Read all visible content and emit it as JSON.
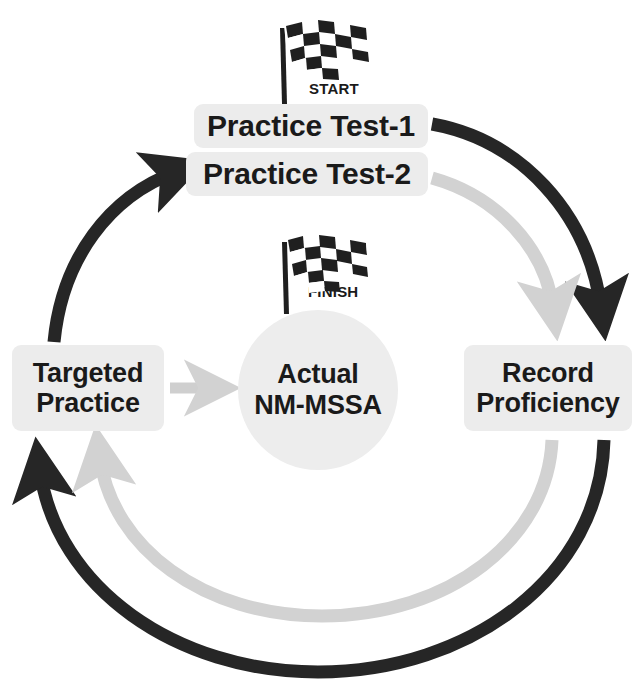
{
  "diagram": {
    "name": "NM-MSSA practice test preparation cycle",
    "background": "#ffffff",
    "colors": {
      "dark_arrow": "#262626",
      "light_arrow": "#d2d2d2",
      "box_fill": "#ececec",
      "circle_fill": "#ededed",
      "text": "#1a1a1a"
    }
  },
  "nodes": {
    "practice_test_1": "Practice Test-1",
    "practice_test_2": "Practice Test-2",
    "targeted_practice": "Targeted\nPractice",
    "targeted_practice_line1": "Targeted",
    "targeted_practice_line2": "Practice",
    "record_proficiency_line1": "Record",
    "record_proficiency_line2": "Proficiency",
    "center_line1": "Actual",
    "center_line2": "NM-MSSA"
  },
  "flags": {
    "start": {
      "icon": "checkered-flag-icon",
      "label": "START"
    },
    "finish": {
      "icon": "checkered-flag-icon",
      "label": "FINISH"
    }
  },
  "arrows": [
    {
      "name": "test1-to-record",
      "color": "#262626",
      "from": "Practice Test-1",
      "to": "Record Proficiency",
      "direction": "clockwise"
    },
    {
      "name": "test2-to-record",
      "color": "#d2d2d2",
      "from": "Practice Test-2",
      "to": "Record Proficiency",
      "direction": "clockwise"
    },
    {
      "name": "record-to-targeted-outer",
      "color": "#262626",
      "from": "Record Proficiency",
      "to": "Targeted Practice",
      "direction": "clockwise"
    },
    {
      "name": "record-to-targeted-inner",
      "color": "#d2d2d2",
      "from": "Record Proficiency",
      "to": "Targeted Practice",
      "direction": "clockwise"
    },
    {
      "name": "targeted-to-test2",
      "color": "#262626",
      "from": "Targeted Practice",
      "to": "Practice Test-2",
      "direction": "clockwise"
    },
    {
      "name": "targeted-to-center",
      "color": "#d2d2d2",
      "from": "Targeted Practice",
      "to": "Actual NM-MSSA",
      "direction": "straight-right"
    }
  ]
}
